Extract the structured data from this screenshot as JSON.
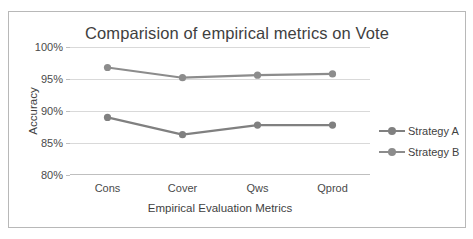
{
  "chart_data": {
    "type": "line",
    "title": "Comparision of empirical metrics on Vote",
    "xlabel": "Empirical Evaluation Metrics",
    "ylabel": "Accuracy",
    "categories": [
      "Cons",
      "Cover",
      "Qws",
      "Qprod"
    ],
    "ytick_labels": [
      "100%",
      "95%",
      "90%",
      "85%",
      "80%"
    ],
    "ytick_values": [
      100,
      95,
      90,
      85,
      80
    ],
    "ylim": [
      80,
      100
    ],
    "y_unit": "percent",
    "grid": true,
    "legend_position": "right",
    "series": [
      {
        "name": "Strategy A",
        "color": "#808080",
        "values": [
          89.0,
          86.3,
          87.8,
          87.8
        ]
      },
      {
        "name": "Strategy B",
        "color": "#8c8c8c",
        "values": [
          96.8,
          95.2,
          95.6,
          95.8
        ]
      }
    ]
  },
  "colors": {
    "frame_border": "#b8b8b8",
    "gridline": "#d9d9d9",
    "axis_line": "#bfbfbf",
    "text": "#3f3f3f",
    "tick_text": "#4a4a4a"
  }
}
